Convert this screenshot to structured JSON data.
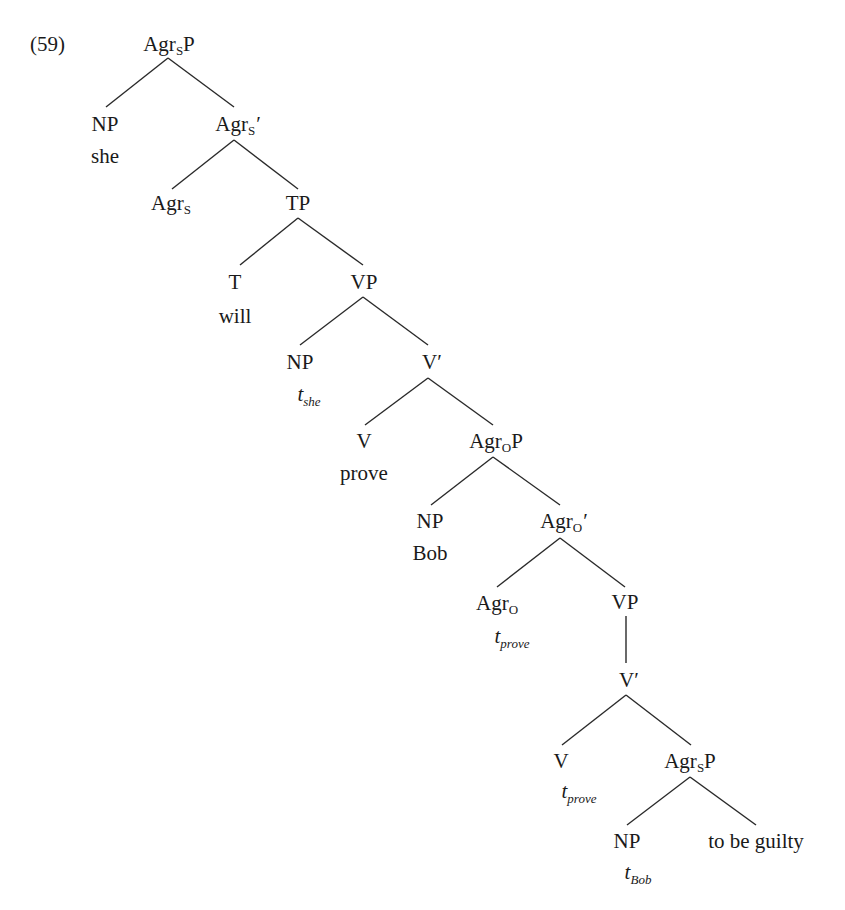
{
  "example_number": "(59)",
  "tree": {
    "root": {
      "cat": "Agr",
      "sub": "S",
      "suffix": "P"
    },
    "np_subject": {
      "cat": "NP",
      "word": "she"
    },
    "agrs_bar": {
      "cat": "Agr",
      "sub": "S",
      "suffix": "′"
    },
    "agrs_head": {
      "cat": "Agr",
      "sub": "S"
    },
    "tp": {
      "cat": "TP"
    },
    "t_head": {
      "cat": "T",
      "word": "will"
    },
    "vp1": {
      "cat": "VP"
    },
    "np_trace_she": {
      "cat": "NP",
      "trace": "t",
      "trace_sub": "she"
    },
    "v_bar1": {
      "cat": "V′"
    },
    "v_head1": {
      "cat": "V",
      "word": "prove"
    },
    "agrop": {
      "cat": "Agr",
      "sub": "O",
      "suffix": "P"
    },
    "np_object": {
      "cat": "NP",
      "word": "Bob"
    },
    "agro_bar": {
      "cat": "Agr",
      "sub": "O",
      "suffix": "′"
    },
    "agro_head": {
      "cat": "Agr",
      "sub": "O",
      "trace": "t",
      "trace_sub": "prove"
    },
    "vp2": {
      "cat": "VP"
    },
    "v_bar2": {
      "cat": "V′"
    },
    "v_head2": {
      "cat": "V",
      "trace": "t",
      "trace_sub": "prove"
    },
    "agrsp2": {
      "cat": "Agr",
      "sub": "S",
      "suffix": "P"
    },
    "np_trace_bob": {
      "cat": "NP",
      "trace": "t",
      "trace_sub": "Bob"
    },
    "predicate": {
      "text": "to be guilty"
    }
  },
  "colors": {
    "ink": "#1a1a1a",
    "background": "#ffffff"
  }
}
